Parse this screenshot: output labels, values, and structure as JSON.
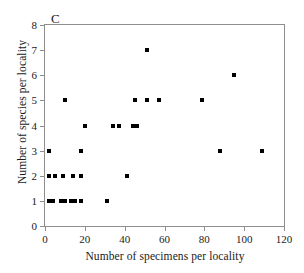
{
  "chart_data": {
    "type": "scatter",
    "title": "",
    "panel_label": "C",
    "xlabel": "Number of specimens per locality",
    "ylabel": "Number of species per locality",
    "xlim": [
      0,
      120
    ],
    "ylim": [
      0,
      8
    ],
    "xticks": [
      0,
      20,
      40,
      60,
      80,
      100,
      120
    ],
    "yticks": [
      0,
      1,
      2,
      3,
      4,
      5,
      6,
      7,
      8
    ],
    "xtick_labels": [
      "0",
      "20",
      "40",
      "60",
      "80",
      "100",
      "120"
    ],
    "ytick_labels": [
      "0",
      "1",
      "2",
      "3",
      "4",
      "5",
      "6",
      "7",
      "8"
    ],
    "grid": false,
    "legend": null,
    "marker": "square",
    "marker_color": "#000000",
    "points": [
      {
        "x": 2,
        "y": 1
      },
      {
        "x": 4,
        "y": 1
      },
      {
        "x": 8,
        "y": 1
      },
      {
        "x": 10,
        "y": 1
      },
      {
        "x": 13,
        "y": 1
      },
      {
        "x": 15,
        "y": 1
      },
      {
        "x": 18,
        "y": 1
      },
      {
        "x": 31,
        "y": 1
      },
      {
        "x": 2,
        "y": 2
      },
      {
        "x": 5,
        "y": 2
      },
      {
        "x": 9,
        "y": 2
      },
      {
        "x": 14,
        "y": 2
      },
      {
        "x": 18,
        "y": 2
      },
      {
        "x": 41,
        "y": 2
      },
      {
        "x": 2,
        "y": 3
      },
      {
        "x": 18,
        "y": 3
      },
      {
        "x": 88,
        "y": 3
      },
      {
        "x": 109,
        "y": 3
      },
      {
        "x": 20,
        "y": 4
      },
      {
        "x": 34,
        "y": 4
      },
      {
        "x": 37,
        "y": 4
      },
      {
        "x": 44,
        "y": 4
      },
      {
        "x": 46,
        "y": 4
      },
      {
        "x": 10,
        "y": 5
      },
      {
        "x": 45,
        "y": 5
      },
      {
        "x": 51,
        "y": 5
      },
      {
        "x": 57,
        "y": 5
      },
      {
        "x": 79,
        "y": 5
      },
      {
        "x": 95,
        "y": 6
      },
      {
        "x": 51,
        "y": 7
      }
    ]
  }
}
